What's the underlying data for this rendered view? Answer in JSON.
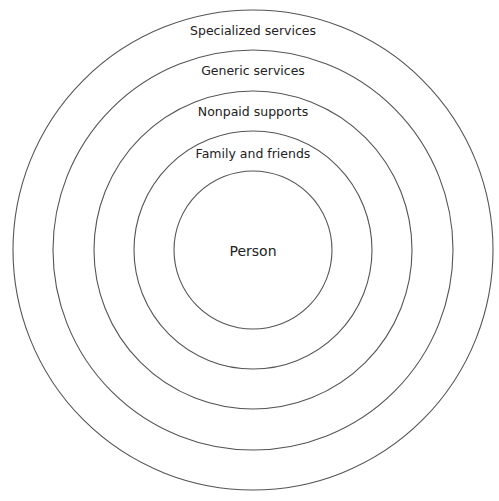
{
  "diagram": {
    "type": "concentric-circles",
    "center": {
      "x": 253,
      "y": 250
    },
    "rings": [
      {
        "label": "Specialized services",
        "radius": 240
      },
      {
        "label": "Generic services",
        "radius": 200
      },
      {
        "label": "Nonpaid supports",
        "radius": 159
      },
      {
        "label": "Family and friends",
        "radius": 119
      },
      {
        "label": "Person",
        "radius": 79
      }
    ],
    "colors": {
      "stroke": "#555555",
      "text": "#222222",
      "background": "#ffffff"
    }
  }
}
